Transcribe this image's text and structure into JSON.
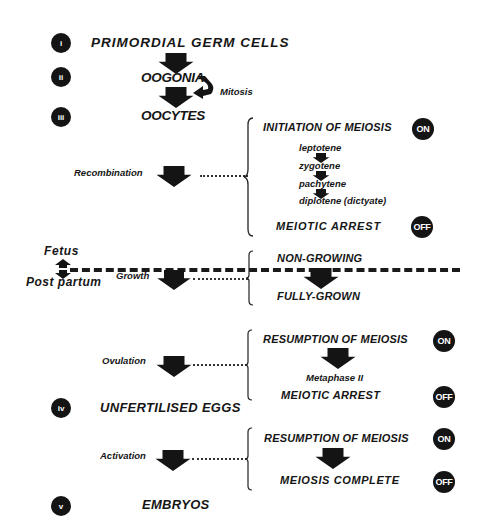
{
  "stages": [
    {
      "numeral": "i",
      "label": "PRIMORDIAL GERM CELLS"
    },
    {
      "numeral": "ii",
      "label": "OOGONIA"
    },
    {
      "numeral": "iii",
      "label": "OOCYTES"
    },
    {
      "numeral": "iv",
      "label": "UNFERTILISED EGGS"
    },
    {
      "numeral": "v",
      "label": "EMBRYOS"
    }
  ],
  "mitosis_label": "Mitosis",
  "processes": {
    "recombination": "Recombination",
    "growth": "Growth",
    "ovulation": "Ovulation",
    "activation": "Activation"
  },
  "divider": {
    "above": "Fetus",
    "below": "Post partum"
  },
  "recombination_block": {
    "start": "INITIATION OF MEIOSIS",
    "start_badge": "ON",
    "substages": [
      "leptotene",
      "zygotene",
      "pachytene",
      "diplotene (dictyate)"
    ],
    "end": "MEIOTIC ARREST",
    "end_badge": "OFF"
  },
  "growth_block": {
    "start": "NON-GROWING",
    "end": "FULLY-GROWN"
  },
  "ovulation_block": {
    "start": "RESUMPTION OF MEIOSIS",
    "start_badge": "ON",
    "middle": "Metaphase II",
    "end": "MEIOTIC ARREST",
    "end_badge": "OFF"
  },
  "activation_block": {
    "start": "RESUMPTION OF MEIOSIS",
    "start_badge": "ON",
    "end": "MEIOSIS COMPLETE",
    "end_badge": "OFF"
  }
}
